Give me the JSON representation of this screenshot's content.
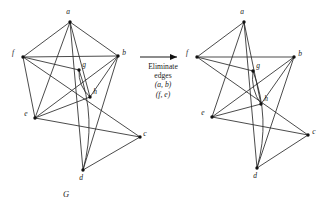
{
  "figure": {
    "caption_left": "G",
    "transform": {
      "line1": "Eliminate",
      "line2": "edges",
      "line3": "(a, b)",
      "line4": "(f, e)",
      "arrow": "right-arrow"
    },
    "graphs": [
      {
        "id": "graph-G",
        "label": "G",
        "origin_x": 0,
        "vertices": [
          {
            "id": "a",
            "label": "a",
            "x": 70,
            "y": 22,
            "lx": 68,
            "ly": 14
          },
          {
            "id": "f",
            "label": "f",
            "x": 23,
            "y": 57,
            "lx": 13,
            "ly": 55
          },
          {
            "id": "b",
            "label": "b",
            "x": 118,
            "y": 56,
            "lx": 124,
            "ly": 55
          },
          {
            "id": "g",
            "label": "g",
            "x": 79,
            "y": 70,
            "lx": 84,
            "ly": 67
          },
          {
            "id": "h",
            "label": "h",
            "x": 90,
            "y": 97,
            "lx": 95,
            "ly": 94
          },
          {
            "id": "e",
            "label": "e",
            "x": 35,
            "y": 118,
            "lx": 26,
            "ly": 116
          },
          {
            "id": "c",
            "label": "c",
            "x": 140,
            "y": 137,
            "lx": 145,
            "ly": 136
          },
          {
            "id": "d",
            "label": "d",
            "x": 83,
            "y": 170,
            "lx": 81,
            "ly": 180
          }
        ],
        "edges": [
          {
            "from": "a",
            "to": "f"
          },
          {
            "from": "a",
            "to": "b"
          },
          {
            "from": "a",
            "to": "e"
          },
          {
            "from": "a",
            "to": "h"
          },
          {
            "from": "a",
            "to": "d"
          },
          {
            "from": "f",
            "to": "b"
          },
          {
            "from": "f",
            "to": "g"
          },
          {
            "from": "f",
            "to": "e"
          },
          {
            "from": "f",
            "to": "c"
          },
          {
            "from": "b",
            "to": "e"
          },
          {
            "from": "b",
            "to": "d"
          },
          {
            "from": "e",
            "to": "h"
          },
          {
            "from": "e",
            "to": "c"
          },
          {
            "from": "c",
            "to": "d"
          },
          {
            "from": "h",
            "to": "b"
          }
        ],
        "curved_edges": [
          {
            "from": "g",
            "to": "d",
            "bow": -16
          },
          {
            "from": "g",
            "to": "h",
            "bow": 7
          }
        ]
      },
      {
        "id": "graph-G-prime",
        "label": "",
        "origin_x": 174,
        "vertices": [
          {
            "id": "a",
            "label": "a",
            "x": 70,
            "y": 22,
            "lx": 68,
            "ly": 14
          },
          {
            "id": "f",
            "label": "f",
            "x": 23,
            "y": 57,
            "lx": 13,
            "ly": 55
          },
          {
            "id": "b",
            "label": "b",
            "x": 120,
            "y": 57,
            "lx": 126,
            "ly": 56
          },
          {
            "id": "g",
            "label": "g",
            "x": 79,
            "y": 71,
            "lx": 84,
            "ly": 68
          },
          {
            "id": "h",
            "label": "h",
            "x": 87,
            "y": 104,
            "lx": 92,
            "ly": 101
          },
          {
            "id": "e",
            "label": "e",
            "x": 38,
            "y": 117,
            "lx": 29,
            "ly": 115
          },
          {
            "id": "c",
            "label": "c",
            "x": 134,
            "y": 135,
            "lx": 140,
            "ly": 134
          },
          {
            "id": "d",
            "label": "d",
            "x": 83,
            "y": 168,
            "lx": 81,
            "ly": 178
          }
        ],
        "edges": [
          {
            "from": "a",
            "to": "f"
          },
          {
            "from": "a",
            "to": "e"
          },
          {
            "from": "a",
            "to": "h"
          },
          {
            "from": "a",
            "to": "d"
          },
          {
            "from": "f",
            "to": "b"
          },
          {
            "from": "f",
            "to": "g"
          },
          {
            "from": "f",
            "to": "c"
          },
          {
            "from": "b",
            "to": "e"
          },
          {
            "from": "b",
            "to": "d"
          },
          {
            "from": "e",
            "to": "h"
          },
          {
            "from": "e",
            "to": "c"
          },
          {
            "from": "c",
            "to": "d"
          },
          {
            "from": "h",
            "to": "b"
          }
        ],
        "curved_edges": [
          {
            "from": "g",
            "to": "d",
            "bow": -16
          },
          {
            "from": "g",
            "to": "h",
            "bow": 7
          }
        ]
      }
    ]
  },
  "colors": {
    "edge": "#2b2b2b",
    "node": "#111111",
    "text": "#1a1a1a",
    "background": "#ffffff"
  }
}
